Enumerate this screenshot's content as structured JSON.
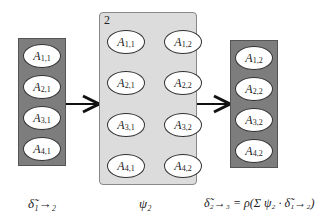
{
  "left_column": {
    "nodes": [
      {
        "base": "A",
        "sub": "1,1"
      },
      {
        "base": "A",
        "sub": "2,1"
      },
      {
        "base": "A",
        "sub": "3,1"
      },
      {
        "base": "A",
        "sub": "4,1"
      }
    ],
    "caption": "δ̃₁→₂"
  },
  "middle_panel": {
    "plate_number": "2",
    "left_nodes": [
      {
        "base": "A",
        "sub": "1,1"
      },
      {
        "base": "A",
        "sub": "2,1"
      },
      {
        "base": "A",
        "sub": "3,1"
      },
      {
        "base": "A",
        "sub": "4,1"
      }
    ],
    "right_nodes": [
      {
        "base": "A",
        "sub": "1,2"
      },
      {
        "base": "A",
        "sub": "2,2"
      },
      {
        "base": "A",
        "sub": "3,2"
      },
      {
        "base": "A",
        "sub": "4,2"
      }
    ],
    "caption": "ψ₂"
  },
  "right_column": {
    "nodes": [
      {
        "base": "A",
        "sub": "1,2"
      },
      {
        "base": "A",
        "sub": "2,2"
      },
      {
        "base": "A",
        "sub": "3,2"
      },
      {
        "base": "A",
        "sub": "4,2"
      }
    ],
    "caption": "δ̃₂→₃ = ρ(Σ ψ₂ · δ̃₁→₂)"
  },
  "colors": {
    "column_fill": "#7d7d7d",
    "panel_fill": "#dcdcdc",
    "node_fill": "#ffffff"
  }
}
